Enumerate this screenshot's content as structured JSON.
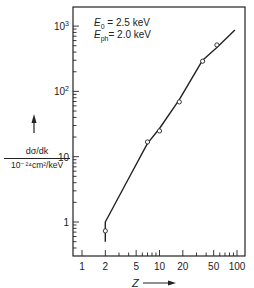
{
  "chart_data": {
    "type": "line",
    "title": "",
    "xlabel": "Z",
    "ylabel": "dσ/dk / 10⁻²⁴cm²/keV",
    "xscale": "log",
    "yscale": "log",
    "xlim": [
      0.8,
      130
    ],
    "ylim": [
      0.3,
      1900
    ],
    "x_ticks": [
      1,
      2,
      5,
      10,
      20,
      50,
      100
    ],
    "x_tick_labels": [
      "1",
      "2",
      "5",
      "10",
      "20",
      "50",
      "100"
    ],
    "y_ticks": [
      1,
      10,
      100,
      1000
    ],
    "y_tick_labels": [
      "1",
      "10",
      "10²",
      "10³"
    ],
    "grid": false,
    "annotations": [
      "E0 = 2.5 keV",
      "Eph = 2.0 keV"
    ],
    "series": [
      {
        "name": "theory curve",
        "style": "line",
        "x": [
          2,
          2,
          3.9,
          7,
          10,
          18,
          36,
          55,
          94
        ],
        "y": [
          0.5,
          1.0,
          4.4,
          16,
          27,
          75,
          300,
          470,
          870
        ]
      },
      {
        "name": "measured",
        "style": "open-circle",
        "x": [
          2,
          7,
          10,
          18,
          36,
          55
        ],
        "y": [
          0.73,
          16.8,
          24.8,
          69,
          290,
          515
        ]
      }
    ]
  },
  "labels": {
    "e0_label": "E",
    "e0_sub": "0",
    "e0_value": " = 2.5 keV",
    "eph_label": "E",
    "eph_sub": "ph",
    "eph_value": "= 2.0 keV",
    "y_numerator": "dσ/dk",
    "y_denominator": "10⁻²⁴cm²/keV",
    "x_axis_label": "Z"
  }
}
